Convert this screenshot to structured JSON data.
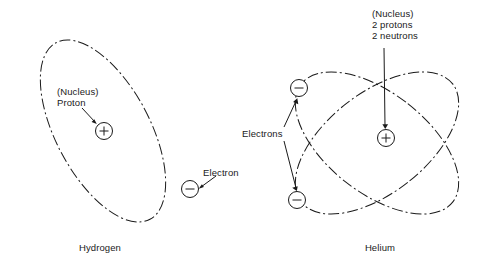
{
  "figure": {
    "background_color": "#ffffff",
    "line_color": "#1a1a1a"
  },
  "atoms": [
    {
      "id": "hydrogen",
      "caption": "Hydrogen",
      "nucleus": {
        "sign": "+",
        "label_line1": "(Nucleus)",
        "label_line2": "Proton"
      },
      "electrons": [
        {
          "sign": "−",
          "label": "Electron"
        }
      ],
      "orbit_count": 1
    },
    {
      "id": "helium",
      "caption": "Helium",
      "nucleus": {
        "sign": "+",
        "label_line1": "(Nucleus)",
        "label_line2": "2 protons",
        "label_line3": "2 neutrons"
      },
      "electrons": [
        {
          "sign": "−",
          "label": "Electrons"
        },
        {
          "sign": "−",
          "label": "Electrons"
        }
      ],
      "electrons_group_label": "Electrons",
      "orbit_count": 2
    }
  ],
  "labels": {
    "hydrogen_nucleus_l1": "(Nucleus)",
    "hydrogen_nucleus_l2": "Proton",
    "hydrogen_electron": "Electron",
    "hydrogen_caption": "Hydrogen",
    "helium_nucleus_l1": "(Nucleus)",
    "helium_nucleus_l2": "2 protons",
    "helium_nucleus_l3": "2 neutrons",
    "helium_electrons": "Electrons",
    "helium_caption": "Helium"
  },
  "signs": {
    "plus": "+",
    "minus": "−"
  }
}
